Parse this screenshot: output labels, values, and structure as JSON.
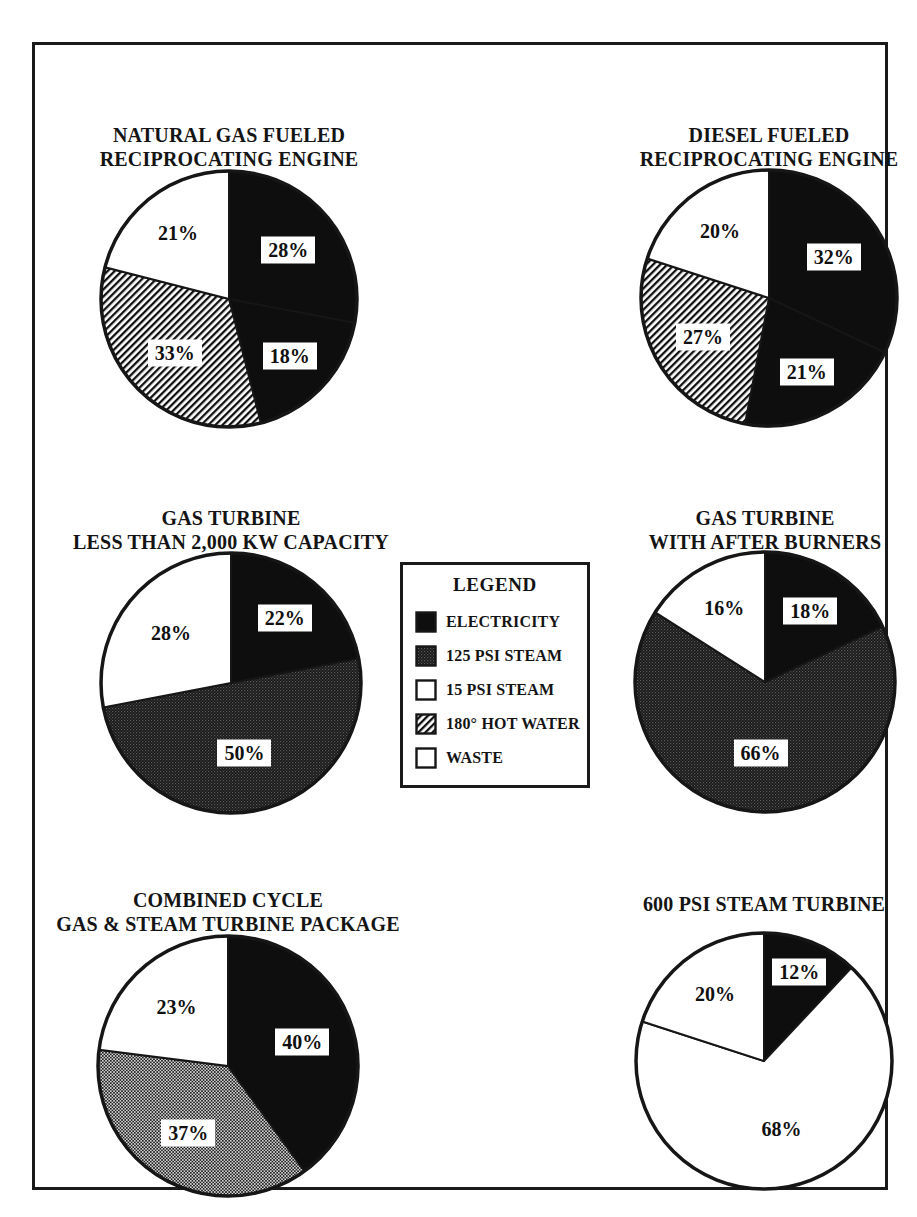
{
  "palette": {
    "ink": "#161616",
    "paper": "#ffffff"
  },
  "legend": {
    "title": "LEGEND",
    "items": [
      {
        "label": "ELECTRICITY",
        "fill": "black"
      },
      {
        "label": "125 PSI STEAM",
        "fill": "stipple_dark"
      },
      {
        "label": "15 PSI STEAM",
        "fill": "white"
      },
      {
        "label": "180° HOT WATER",
        "fill": "hatch"
      },
      {
        "label": "WASTE",
        "fill": "white"
      }
    ]
  },
  "chart_data": [
    {
      "id": "natural-gas-reciprocating-engine",
      "type": "pie",
      "title": "NATURAL GAS FUELED RECIPROCATING ENGINE",
      "title_lines": [
        "NATURAL GAS FUELED",
        "RECIPROCATING ENGINE"
      ],
      "start_angle_deg": 0,
      "direction": "clockwise",
      "slices": [
        {
          "label": "ELECTRICITY",
          "value": 28,
          "text": "28%",
          "fill": "black",
          "boxed": true
        },
        {
          "label": "125 PSI STEAM",
          "value": 18,
          "text": "18%",
          "fill": "black",
          "boxed": true
        },
        {
          "label": "180° HOT WATER",
          "value": 33,
          "text": "33%",
          "fill": "hatch",
          "boxed": true
        },
        {
          "label": "WASTE",
          "value": 21,
          "text": "21%",
          "fill": "white",
          "boxed": false
        }
      ]
    },
    {
      "id": "diesel-reciprocating-engine",
      "type": "pie",
      "title": "DIESEL FUELED RECIPROCATING ENGINE",
      "title_lines": [
        "DIESEL FUELED",
        "RECIPROCATING ENGINE"
      ],
      "start_angle_deg": 0,
      "direction": "clockwise",
      "slices": [
        {
          "label": "ELECTRICITY",
          "value": 32,
          "text": "32%",
          "fill": "black",
          "boxed": true
        },
        {
          "label": "125 PSI STEAM",
          "value": 21,
          "text": "21%",
          "fill": "black",
          "boxed": true
        },
        {
          "label": "180° HOT WATER",
          "value": 27,
          "text": "27%",
          "fill": "hatch",
          "boxed": true
        },
        {
          "label": "WASTE",
          "value": 20,
          "text": "20%",
          "fill": "white",
          "boxed": false
        }
      ]
    },
    {
      "id": "gas-turbine-under-2000-kw",
      "type": "pie",
      "title": "GAS TURBINE LESS THAN 2,000 KW CAPACITY",
      "title_lines": [
        "GAS TURBINE",
        "LESS THAN 2,000 KW CAPACITY"
      ],
      "start_angle_deg": 0,
      "direction": "clockwise",
      "slices": [
        {
          "label": "ELECTRICITY",
          "value": 22,
          "text": "22%",
          "fill": "black",
          "boxed": true
        },
        {
          "label": "125 PSI STEAM",
          "value": 50,
          "text": "50%",
          "fill": "stipple_dark",
          "boxed": true
        },
        {
          "label": "WASTE",
          "value": 28,
          "text": "28%",
          "fill": "white",
          "boxed": false
        }
      ]
    },
    {
      "id": "gas-turbine-with-after-burners",
      "type": "pie",
      "title": "GAS TURBINE WITH AFTER BURNERS",
      "title_lines": [
        "GAS TURBINE",
        "WITH AFTER BURNERS"
      ],
      "start_angle_deg": 0,
      "direction": "clockwise",
      "slices": [
        {
          "label": "ELECTRICITY",
          "value": 18,
          "text": "18%",
          "fill": "black",
          "boxed": true
        },
        {
          "label": "125 PSI STEAM",
          "value": 66,
          "text": "66%",
          "fill": "stipple_dark",
          "boxed": true
        },
        {
          "label": "WASTE",
          "value": 16,
          "text": "16%",
          "fill": "white",
          "boxed": false
        }
      ]
    },
    {
      "id": "combined-cycle-gas-steam-turbine-package",
      "type": "pie",
      "title": "COMBINED CYCLE GAS & STEAM TURBINE PACKAGE",
      "title_lines": [
        "COMBINED CYCLE",
        "GAS & STEAM TURBINE PACKAGE"
      ],
      "start_angle_deg": 0,
      "direction": "clockwise",
      "slices": [
        {
          "label": "ELECTRICITY",
          "value": 40,
          "text": "40%",
          "fill": "black",
          "boxed": true
        },
        {
          "label": "125 PSI STEAM",
          "value": 37,
          "text": "37%",
          "fill": "stipple_gray",
          "boxed": true
        },
        {
          "label": "WASTE",
          "value": 23,
          "text": "23%",
          "fill": "white",
          "boxed": false
        }
      ]
    },
    {
      "id": "600-psi-steam-turbine",
      "type": "pie",
      "title": "600 PSI STEAM TURBINE",
      "title_lines": [
        "600 PSI STEAM TURBINE"
      ],
      "start_angle_deg": 0,
      "direction": "clockwise",
      "slices": [
        {
          "label": "ELECTRICITY",
          "value": 12,
          "text": "12%",
          "fill": "black",
          "boxed": true
        },
        {
          "label": "15 PSI STEAM",
          "value": 68,
          "text": "68%",
          "fill": "white",
          "boxed": false
        },
        {
          "label": "WASTE",
          "value": 20,
          "text": "20%",
          "fill": "white",
          "boxed": false
        }
      ]
    }
  ]
}
